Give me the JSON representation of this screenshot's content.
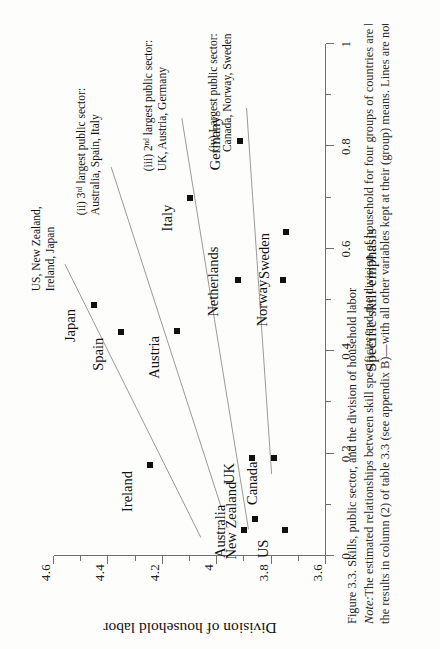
{
  "figure": {
    "caption_title": "Figure 3.3. Skills, public sector, and the division of household labor",
    "note_label": "Note:",
    "note_line1": "The estimated relationships between skill specificity and the division of household for four groups of countries are based o",
    "note_line2": "the results in column (2) of table 3.3 (see appendix B)—with all other variables kept at their (group) means. Lines are not prese"
  },
  "chart_data": {
    "type": "scatter",
    "title": "Skills, public sector, and the division of household labor",
    "xlabel": "Specific skill emphasis",
    "ylabel": "Division of household labor",
    "xlim": [
      0,
      1
    ],
    "ylim": [
      3.6,
      4.6
    ],
    "xticks": [
      0,
      0.1,
      0.2,
      0.3,
      0.4,
      0.5,
      0.6,
      0.7,
      0.8,
      0.9,
      1
    ],
    "xticklabels": [
      "0",
      "",
      "0.2",
      "",
      "0.4",
      "",
      "0.6",
      "",
      "0.8",
      "",
      "1"
    ],
    "yticks": [
      3.6,
      3.7,
      3.8,
      3.9,
      4.0,
      4.1,
      4.2,
      4.3,
      4.4,
      4.5,
      4.6
    ],
    "yticklabels": [
      "3.6",
      "",
      "3.8",
      "",
      "4",
      "",
      "4.2",
      "",
      "4.4",
      "",
      "4.6"
    ],
    "grid": false,
    "legend": "none",
    "points": [
      {
        "label": "Japan",
        "x": 0.49,
        "y": 4.452,
        "label_dx": -0.04,
        "label_dy": 0.055
      },
      {
        "label": "Spain",
        "x": 0.437,
        "y": 4.352,
        "label_dx": -0.043,
        "label_dy": 0.052
      },
      {
        "label": "Ireland",
        "x": 0.178,
        "y": 4.248,
        "label_dx": -0.052,
        "label_dy": 0.05
      },
      {
        "label": "Austria",
        "x": 0.44,
        "y": 4.148,
        "label_dx": -0.052,
        "label_dy": 0.05
      },
      {
        "label": "Italy",
        "x": 0.7,
        "y": 4.1,
        "label_dx": -0.04,
        "label_dy": 0.052
      },
      {
        "label": "Netherlands",
        "x": 0.54,
        "y": 3.925,
        "label_dx": -0.004,
        "label_dy": 0.058
      },
      {
        "label": "Germany",
        "x": 0.81,
        "y": 3.918,
        "label_dx": -0.004,
        "label_dy": 0.058
      },
      {
        "label": "UK",
        "x": 0.192,
        "y": 3.872,
        "label_dx": -0.031,
        "label_dy": 0.05
      },
      {
        "label": "Australia",
        "x": 0.05,
        "y": 3.9,
        "label_dx": -0.002,
        "label_dy": 0.058
      },
      {
        "label": "New Zealand",
        "x": 0.073,
        "y": 3.862,
        "label_dx": -0.004,
        "label_dy": 0.056
      },
      {
        "label": "Canada",
        "x": 0.192,
        "y": 3.792,
        "label_dx": -0.05,
        "label_dy": 0.048
      },
      {
        "label": "Norway",
        "x": 0.54,
        "y": 3.758,
        "label_dx": -0.046,
        "label_dy": 0.046
      },
      {
        "label": "Sweden",
        "x": 0.632,
        "y": 3.748,
        "label_dx": -0.046,
        "label_dy": 0.046
      },
      {
        "label": "US",
        "x": 0.05,
        "y": 3.752,
        "label_dx": -0.036,
        "label_dy": 0.046
      }
    ],
    "fit_lines": [
      {
        "group": "i",
        "x1": 0.036,
        "y1": 4.06,
        "x2": 0.57,
        "y2": 4.56
      },
      {
        "group": "ii",
        "x1": 0.09,
        "y1": 3.982,
        "x2": 0.76,
        "y2": 4.39
      },
      {
        "group": "iii",
        "x1": 0.052,
        "y1": 3.885,
        "x2": 0.855,
        "y2": 4.13
      },
      {
        "group": "iv",
        "x1": 0.16,
        "y1": 3.8,
        "x2": 0.875,
        "y2": 3.892
      }
    ],
    "annotations": [
      {
        "id": "i",
        "lines": [
          "US, New Zealand,",
          "Ireland, Japan"
        ],
        "x": 0.6,
        "y": 4.588
      },
      {
        "id": "ii",
        "lines": [
          "(ii) 3ʳᵈ largest public sector:",
          "Australia,  Spain, Italy"
        ],
        "x": 0.79,
        "y": 4.425
      },
      {
        "id": "iii",
        "lines": [
          "(iii) 2ⁿᵈ largest public sector:",
          "UK, Austria, Germany"
        ],
        "x": 0.88,
        "y": 4.176
      },
      {
        "id": "iv",
        "lines": [
          "(iv) Largest public sector:",
          "Canada, Norway, Sweden"
        ],
        "x": 0.905,
        "y": 3.94
      }
    ]
  }
}
